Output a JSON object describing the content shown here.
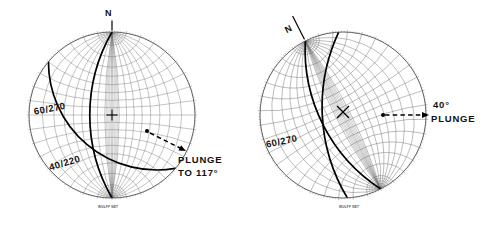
{
  "figure": {
    "type": "stereonet-pair",
    "background_color": "#ffffff",
    "ink_color": "#000000",
    "grid_color": "#6a6a6a"
  },
  "panels": [
    {
      "id": "left",
      "net_caption": "WULFF NET",
      "north_label": "N",
      "north_rotation_deg": 0,
      "center_marker": "cross",
      "grid_rotation_deg": 0,
      "planes": [
        {
          "label": "60/270",
          "dip": 60,
          "dip_direction": 270
        },
        {
          "label": "40/220",
          "dip": 40,
          "dip_direction": 220
        }
      ],
      "annotation": {
        "line1": "PLUNGE",
        "line2": "TO 117°",
        "arrow": "dashed-arrow",
        "plunge_bearing_deg": 117
      }
    },
    {
      "id": "right",
      "net_caption": "WULFF NET",
      "north_label": "N",
      "north_rotation_deg": -27,
      "center_marker": "x",
      "grid_rotation_deg": -27,
      "planes": [
        {
          "label": "60/270",
          "dip": 60,
          "dip_direction": 270
        }
      ],
      "annotation": {
        "line1": "40°",
        "line2": "PLUNGE",
        "arrow": "dashed-arrow",
        "plunge_amount_deg": 40
      }
    }
  ],
  "chart_data": {
    "type": "scatter",
    "projection": "Wulff (equal-angle) stereonet, lower hemisphere",
    "nets": [
      {
        "name": "Unrotated net",
        "great_circles": [
          {
            "name": "60/270",
            "dip": 60,
            "dip_direction": 270
          },
          {
            "name": "40/220",
            "dip": 40,
            "dip_direction": 220
          }
        ],
        "intersection_line": {
          "plunge": 38,
          "trend": 117
        },
        "annotations": [
          "PLUNGE TO 117°"
        ]
      },
      {
        "name": "Rotated net (N rotated 27° CCW)",
        "great_circles": [
          {
            "name": "60/270",
            "dip": 60,
            "dip_direction": 270
          }
        ],
        "intersection_line": {
          "plunge": 40,
          "trend": 117
        },
        "annotations": [
          "40° PLUNGE"
        ]
      }
    ]
  }
}
